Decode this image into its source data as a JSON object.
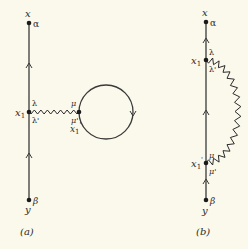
{
  "diagram_a": {
    "caption": "(a)",
    "top_point": {
      "label": "x",
      "index": "α"
    },
    "bottom_point": {
      "label": "y",
      "index": "β"
    },
    "vertex": {
      "label": "x",
      "subscript": "1",
      "index_above": "λ",
      "index_below": "λ'"
    },
    "loop_vertex": {
      "label": "x",
      "subscript": "1",
      "prime": "'",
      "index_above": "μ",
      "index_below": "μ'"
    }
  },
  "diagram_b": {
    "caption": "(b)",
    "top_point": {
      "label": "x",
      "index": "α"
    },
    "bottom_point": {
      "label": "y",
      "index": "β"
    },
    "vertex_upper": {
      "label": "x",
      "subscript": "1",
      "index_above": "λ",
      "index_below": "λ'"
    },
    "vertex_lower": {
      "label": "x",
      "subscript": "1",
      "prime": "'",
      "index_above": "μ",
      "index_below": "μ'"
    }
  }
}
